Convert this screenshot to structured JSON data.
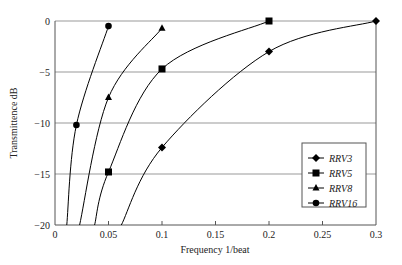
{
  "chart_data": {
    "type": "line",
    "title": "",
    "xlabel": "Frequency 1/beat",
    "ylabel": "Transmittence dB",
    "xlim": [
      0,
      0.3
    ],
    "ylim": [
      -20,
      0
    ],
    "x_ticks": [
      "0",
      "0.05",
      "0.1",
      "0.15",
      "0.2",
      "0.25",
      "0.3"
    ],
    "y_ticks": [
      "0",
      "-5",
      "-10",
      "-15",
      "-20"
    ],
    "grid": "horizontal",
    "legend_position": "lower right (inside)",
    "series": [
      {
        "name": "RRV3",
        "marker": "diamond",
        "points": [
          [
            0.062,
            -20
          ],
          [
            0.1,
            -12.4
          ],
          [
            0.2,
            -3.0
          ],
          [
            0.3,
            0.0
          ]
        ]
      },
      {
        "name": "RRV5",
        "marker": "square",
        "points": [
          [
            0.037,
            -20
          ],
          [
            0.05,
            -14.8
          ],
          [
            0.1,
            -4.7
          ],
          [
            0.2,
            0.0
          ]
        ]
      },
      {
        "name": "RRV8",
        "marker": "triangle",
        "points": [
          [
            0.023,
            -20
          ],
          [
            0.05,
            -7.5
          ],
          [
            0.1,
            -0.7
          ]
        ]
      },
      {
        "name": "RRV16",
        "marker": "circle",
        "points": [
          [
            0.011,
            -20
          ],
          [
            0.02,
            -10.2
          ],
          [
            0.05,
            -0.5
          ]
        ]
      }
    ],
    "markers_shown": {
      "RRV3": [
        [
          0.1,
          -12.4
        ],
        [
          0.2,
          -3.0
        ],
        [
          0.3,
          0.0
        ]
      ],
      "RRV5": [
        [
          0.05,
          -14.8
        ],
        [
          0.1,
          -4.7
        ],
        [
          0.2,
          0.0
        ]
      ],
      "RRV8": [
        [
          0.05,
          -7.5
        ],
        [
          0.1,
          -0.7
        ]
      ],
      "RRV16": [
        [
          0.02,
          -10.2
        ],
        [
          0.05,
          -0.5
        ]
      ]
    }
  },
  "legend": {
    "items": [
      {
        "label": "RRV3"
      },
      {
        "label": "RRV5"
      },
      {
        "label": "RRV8"
      },
      {
        "label": "RRV16"
      }
    ]
  },
  "axes": {
    "x_label": "Frequency 1/beat",
    "y_label": "Transmittence dB"
  }
}
